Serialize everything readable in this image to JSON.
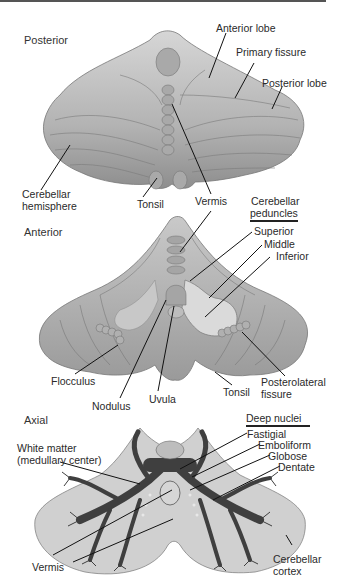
{
  "figure": {
    "panels": [
      {
        "view": "Posterior",
        "labels": {
          "anterior_lobe": "Anterior lobe",
          "primary_fissure": "Primary fissure",
          "posterior_lobe": "Posterior lobe",
          "cerebellar_hemisphere_1": "Cerebellar",
          "cerebellar_hemisphere_2": "hemisphere",
          "tonsil": "Tonsil",
          "vermis": "Vermis"
        }
      },
      {
        "view": "Anterior",
        "header_1": "Cerebellar",
        "header_2": "peduncles",
        "labels": {
          "superior": "Superior",
          "middle": "Middle",
          "inferior": "Inferior",
          "flocculus": "Flocculus",
          "nodulus": "Nodulus",
          "uvula": "Uvula",
          "tonsil": "Tonsil",
          "posterolateral_fissure_1": "Posterolateral",
          "posterolateral_fissure_2": "fissure"
        }
      },
      {
        "view": "Axial",
        "header": "Deep nuclei",
        "labels": {
          "fastigial": "Fastigial",
          "emboliform": "Emboliform",
          "globose": "Globose",
          "dentate": "Dentate",
          "white_matter_1": "White matter",
          "white_matter_2": "(medullary center)",
          "vermis": "Vermis",
          "cerebellar_cortex_1": "Cerebellar",
          "cerebellar_cortex_2": "cortex"
        }
      }
    ],
    "colors": {
      "surface": "#b8b8b8",
      "surface_dark": "#8a8a8a",
      "peduncle_cut": "#d9d9d9",
      "white_matter": "#4a4a4a",
      "cortex": "#cfcfcf",
      "leader_line": "#111111"
    }
  }
}
